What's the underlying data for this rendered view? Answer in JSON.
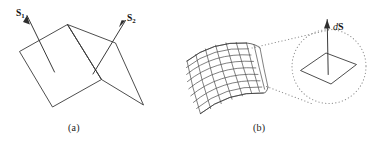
{
  "figure": {
    "background_color": "#ffffff",
    "line_color": "#3a3a3a",
    "dotted_color": "#8c8c8c",
    "width": 368,
    "height": 145
  },
  "panel_a": {
    "caption": "(a)",
    "description": "Two planar surface patches joined along a common fold edge, each with an outward normal vector",
    "vector_1": {
      "symbol": "S",
      "subscript": "1",
      "direction": "up-left"
    },
    "vector_2": {
      "symbol": "S",
      "subscript": "2",
      "direction": "up-right"
    }
  },
  "panel_b": {
    "caption": "(b)",
    "description": "Curved meshed surface with a magnified inset showing a differential surface element and its normal vector",
    "vector_label": {
      "differential": "d",
      "symbol": "S"
    },
    "mesh": {
      "u_lines": 9,
      "v_lines": 9
    }
  }
}
